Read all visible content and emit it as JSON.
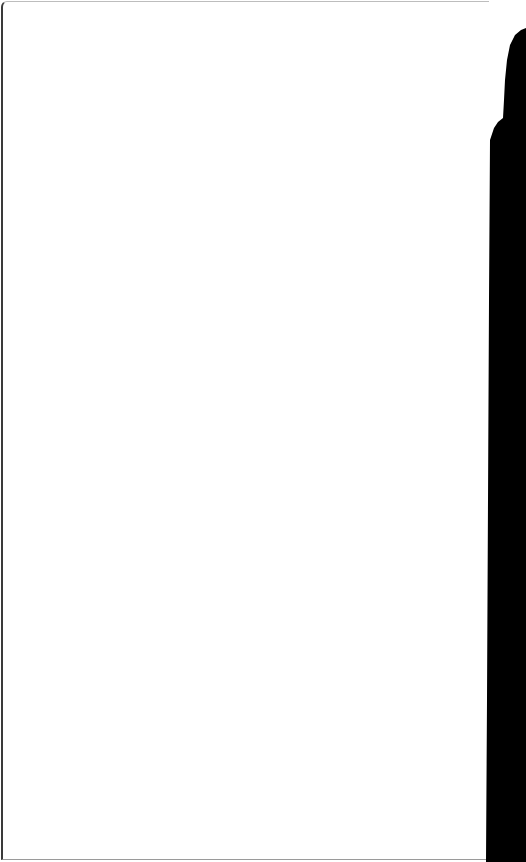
{
  "scene": {
    "description": "Blank white sheet with a dark silhouette along the right edge",
    "colors": {
      "paper": "#ffffff",
      "silhouette": "#000000",
      "edge": "#3a3a3a"
    }
  }
}
